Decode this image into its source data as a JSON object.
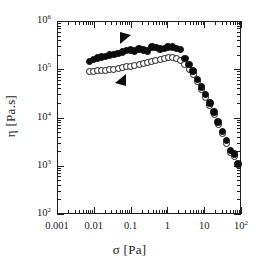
{
  "chart_data": {
    "type": "scatter",
    "title": "",
    "xlabel": "σ [Pa]",
    "ylabel": "η [Pa.s]",
    "xscale": "log",
    "yscale": "log",
    "xlim": [
      0.001,
      100
    ],
    "ylim": [
      100,
      1000000
    ],
    "grid": false,
    "legend": "none",
    "xticks": [
      "0.001",
      "0.01",
      "0.1",
      "1",
      "10",
      "10²"
    ],
    "xtick_values": [
      0.001,
      0.01,
      0.1,
      1,
      10,
      100
    ],
    "yticks": [
      "10²",
      "10³",
      "10⁴",
      "10⁵",
      "10⁶"
    ],
    "ytick_values": [
      100,
      1000,
      10000,
      100000,
      1000000
    ],
    "series": [
      {
        "name": "filled-circles",
        "marker": "filled circle",
        "color": "#0d0d0d",
        "points": [
          {
            "x": 0.0075,
            "y": 145000
          },
          {
            "x": 0.0097,
            "y": 160000
          },
          {
            "x": 0.0125,
            "y": 172000
          },
          {
            "x": 0.0162,
            "y": 178000
          },
          {
            "x": 0.021,
            "y": 185000
          },
          {
            "x": 0.027,
            "y": 196000
          },
          {
            "x": 0.035,
            "y": 200000
          },
          {
            "x": 0.046,
            "y": 212000
          },
          {
            "x": 0.06,
            "y": 228000
          },
          {
            "x": 0.078,
            "y": 245000
          },
          {
            "x": 0.1,
            "y": 252000
          },
          {
            "x": 0.13,
            "y": 238000
          },
          {
            "x": 0.17,
            "y": 262000
          },
          {
            "x": 0.22,
            "y": 252000
          },
          {
            "x": 0.29,
            "y": 240000
          },
          {
            "x": 0.38,
            "y": 290000
          },
          {
            "x": 0.49,
            "y": 280000
          },
          {
            "x": 0.63,
            "y": 262000
          },
          {
            "x": 0.82,
            "y": 272000
          },
          {
            "x": 1.05,
            "y": 290000
          },
          {
            "x": 1.37,
            "y": 288000
          },
          {
            "x": 1.78,
            "y": 272000
          },
          {
            "x": 2.3,
            "y": 255000
          },
          {
            "x": 3.0,
            "y": 168000
          },
          {
            "x": 3.9,
            "y": 125000
          },
          {
            "x": 5.0,
            "y": 92000
          },
          {
            "x": 6.6,
            "y": 62000
          },
          {
            "x": 8.5,
            "y": 43000
          },
          {
            "x": 11.0,
            "y": 30000
          },
          {
            "x": 14.3,
            "y": 20000
          },
          {
            "x": 18.5,
            "y": 13000
          },
          {
            "x": 24.0,
            "y": 8000
          },
          {
            "x": 31.0,
            "y": 5100
          },
          {
            "x": 40.0,
            "y": 3300
          },
          {
            "x": 52.0,
            "y": 2050
          },
          {
            "x": 67.0,
            "y": 1750
          },
          {
            "x": 82.0,
            "y": 1080
          }
        ]
      },
      {
        "name": "open-circles",
        "marker": "open circle",
        "color": "#1a1a1a",
        "points": [
          {
            "x": 0.0075,
            "y": 88000
          },
          {
            "x": 0.0097,
            "y": 90000
          },
          {
            "x": 0.0125,
            "y": 92000
          },
          {
            "x": 0.0162,
            "y": 95000
          },
          {
            "x": 0.021,
            "y": 96000
          },
          {
            "x": 0.027,
            "y": 98000
          },
          {
            "x": 0.035,
            "y": 100000
          },
          {
            "x": 0.046,
            "y": 102000
          },
          {
            "x": 0.06,
            "y": 108000
          },
          {
            "x": 0.078,
            "y": 112000
          },
          {
            "x": 0.1,
            "y": 115000
          },
          {
            "x": 0.13,
            "y": 122000
          },
          {
            "x": 0.17,
            "y": 125000
          },
          {
            "x": 0.22,
            "y": 132000
          },
          {
            "x": 0.29,
            "y": 140000
          },
          {
            "x": 0.38,
            "y": 148000
          },
          {
            "x": 0.49,
            "y": 152000
          },
          {
            "x": 0.63,
            "y": 158000
          },
          {
            "x": 0.82,
            "y": 165000
          },
          {
            "x": 1.05,
            "y": 172000
          },
          {
            "x": 1.37,
            "y": 178000
          },
          {
            "x": 1.78,
            "y": 168000
          },
          {
            "x": 2.3,
            "y": 150000
          },
          {
            "x": 3.0,
            "y": 128000
          },
          {
            "x": 3.9,
            "y": 100000
          },
          {
            "x": 5.0,
            "y": 78000
          },
          {
            "x": 6.6,
            "y": 55000
          },
          {
            "x": 8.5,
            "y": 38000
          },
          {
            "x": 11.0,
            "y": 26000
          },
          {
            "x": 14.3,
            "y": 17500
          },
          {
            "x": 18.5,
            "y": 11500
          },
          {
            "x": 24.0,
            "y": 7200
          },
          {
            "x": 31.0,
            "y": 4600
          },
          {
            "x": 40.0,
            "y": 2950
          },
          {
            "x": 52.0,
            "y": 1850
          },
          {
            "x": 67.0,
            "y": 1550
          }
        ]
      }
    ],
    "annotations": [
      {
        "name": "sweep-down-arrow",
        "symbol": "▼",
        "x": 0.07,
        "y": 470000
      },
      {
        "name": "sweep-up-arrow",
        "symbol": "◀",
        "x": 0.055,
        "y": 62000
      }
    ]
  }
}
